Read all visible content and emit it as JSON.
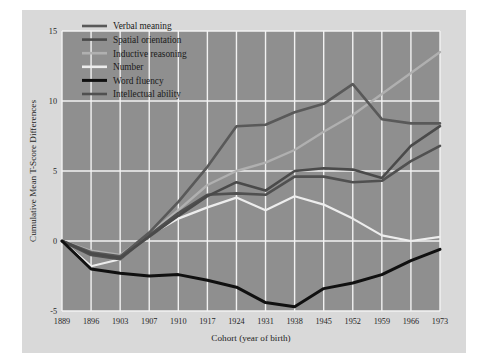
{
  "figure": {
    "background_color": "#d9d9d9",
    "plot_background_color": "#8f8f8f",
    "grid_color": "#f2f2f2"
  },
  "chart_data": {
    "type": "line",
    "title": "",
    "xlabel": "Cohort (year of birth)",
    "ylabel": "Cumulative Mean T-Score Differences",
    "categories": [
      "1889",
      "1896",
      "1903",
      "1907",
      "1910",
      "1917",
      "1924",
      "1931",
      "1938",
      "1945",
      "1952",
      "1959",
      "1966",
      "1973"
    ],
    "xtick_labels": [
      "1889",
      "1896",
      "1903",
      "1907",
      "1910",
      "1917",
      "1924",
      "1931",
      "1938",
      "1945",
      "1952",
      "1959",
      "1966",
      "1973"
    ],
    "ytick_labels": [
      "-5",
      "0",
      "5",
      "10",
      "15"
    ],
    "ylim": [
      -5,
      15
    ],
    "yticks": [
      -5,
      0,
      5,
      10,
      15
    ],
    "grid": true,
    "legend_position": "upper left",
    "series": [
      {
        "name": "Verbal meaning",
        "color": "#595959",
        "width": 2.6,
        "values": [
          0,
          -0.8,
          -1.1,
          0.6,
          2.8,
          5.3,
          8.2,
          8.3,
          9.2,
          9.8,
          11.2,
          8.7,
          8.4,
          8.4
        ]
      },
      {
        "name": "Spatial orientation",
        "color": "#4a4a4a",
        "width": 2.6,
        "values": [
          0,
          -0.9,
          -1.2,
          0.3,
          1.8,
          3.2,
          4.2,
          3.6,
          5.0,
          5.2,
          5.1,
          4.5,
          6.8,
          8.2
        ]
      },
      {
        "name": "Inductive reasoning",
        "color": "#b0b0b0",
        "width": 2.4,
        "values": [
          0,
          -0.7,
          -1.0,
          0.5,
          2.2,
          4.0,
          5.0,
          5.6,
          6.5,
          7.8,
          9.0,
          10.5,
          12.0,
          13.5
        ]
      },
      {
        "name": "Number",
        "color": "#ededed",
        "width": 2.2,
        "values": [
          0,
          -1.8,
          -1.3,
          0.4,
          1.6,
          2.4,
          3.1,
          2.2,
          3.2,
          2.6,
          1.6,
          0.4,
          0.0,
          0.3
        ]
      },
      {
        "name": "Word fluency",
        "color": "#101010",
        "width": 3.0,
        "values": [
          0,
          -2.0,
          -2.3,
          -2.5,
          -2.4,
          -2.8,
          -3.3,
          -4.4,
          -4.7,
          -3.4,
          -3.0,
          -2.4,
          -1.4,
          -0.6
        ]
      },
      {
        "name": "Intellectual ability",
        "color": "#505050",
        "width": 2.6,
        "values": [
          0,
          -1.0,
          -1.3,
          0.4,
          2.0,
          3.3,
          3.4,
          3.3,
          4.6,
          4.6,
          4.2,
          4.3,
          5.7,
          6.8
        ]
      }
    ]
  }
}
